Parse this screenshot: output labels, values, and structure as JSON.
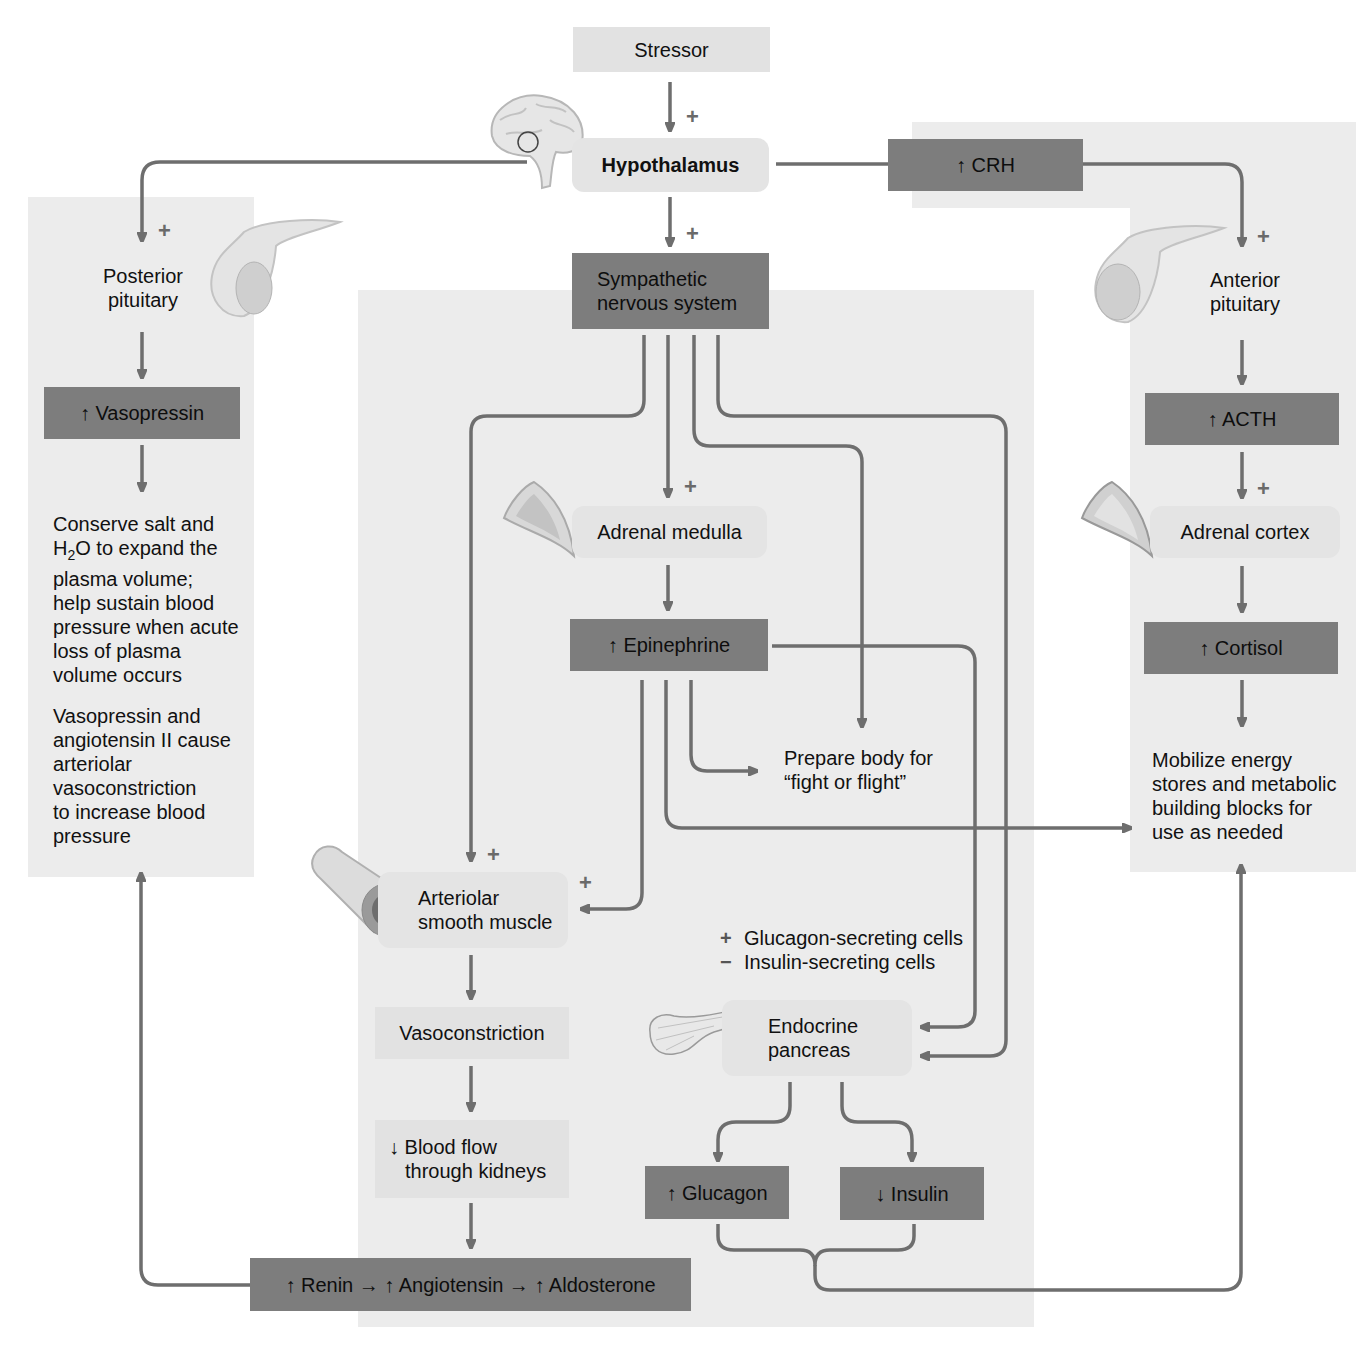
{
  "diagram": {
    "colors": {
      "dark_box": "#7d7d7d",
      "panel": "#ececec",
      "arrow": "#6e6e6e",
      "light_box": "#e2e2e2"
    },
    "top": {
      "stressor": "Stressor",
      "hypothalamus": "Hypothalamus",
      "sympathetic": [
        "Sympathetic",
        "nervous system"
      ],
      "crh": "↑ CRH"
    },
    "left": {
      "posterior_pituitary": [
        "Posterior",
        "pituitary"
      ],
      "vasopressin": "↑ Vasopressin",
      "effect1": [
        "Conserve salt and",
        "H",
        "2",
        "O to expand the",
        "plasma volume;",
        "help sustain blood",
        "pressure when acute",
        "loss of plasma",
        "volume occurs"
      ],
      "effect2": [
        "Vasopressin and",
        "angiotensin II cause",
        "arteriolar",
        "vasoconstriction",
        "to increase blood",
        "pressure"
      ]
    },
    "center": {
      "adrenal_medulla": "Adrenal medulla",
      "epinephrine": "↑ Epinephrine",
      "fight_flight": [
        "Prepare body for",
        "“fight or flight”"
      ],
      "arteriolar": [
        "Arteriolar",
        "smooth muscle"
      ],
      "vasoconstriction": "Vasoconstriction",
      "blood_flow": [
        "↓ Blood flow",
        "through kidneys"
      ],
      "raa": "↑ Renin → ↑ Angiotensin → ↑ Aldosterone",
      "pancreas_effects": [
        {
          "sign": "+",
          "label": "Glucagon-secreting cells"
        },
        {
          "sign": "−",
          "label": "Insulin-secreting cells"
        }
      ],
      "endocrine_pancreas": [
        "Endocrine",
        "pancreas"
      ],
      "glucagon": "↑ Glucagon",
      "insulin": "↓ Insulin"
    },
    "right": {
      "anterior_pituitary": [
        "Anterior",
        "pituitary"
      ],
      "acth": "↑ ACTH",
      "adrenal_cortex": "Adrenal cortex",
      "cortisol": "↑ Cortisol",
      "effect": [
        "Mobilize energy",
        "stores and metabolic",
        "building blocks for",
        "use as needed"
      ]
    },
    "signs": {
      "plus": "+"
    }
  }
}
